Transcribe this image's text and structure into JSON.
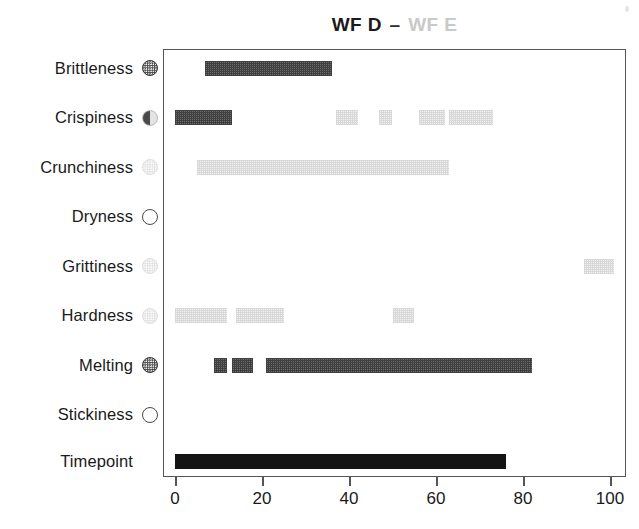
{
  "title": {
    "left": "WF D",
    "dash": "–",
    "right": "WF E",
    "left_color": "#1a1a1a",
    "right_color": "#c9c9c9",
    "full": "WF D – WF E"
  },
  "axes": {
    "x_ticks": [
      "0",
      "20",
      "40",
      "60",
      "80",
      "100"
    ],
    "x_tick_values": [
      0,
      20,
      40,
      60,
      80,
      100
    ],
    "xlim": [
      -1.5,
      105
    ],
    "xlabel": "",
    "ylabel": ""
  },
  "categories": [
    {
      "label": "Brittleness",
      "marker": "dark-dotted-circle"
    },
    {
      "label": "Crispiness",
      "marker": "half-dark-circle"
    },
    {
      "label": "Crunchiness",
      "marker": "light-dotted-circle"
    },
    {
      "label": "Dryness",
      "marker": "open-circle"
    },
    {
      "label": "Grittiness",
      "marker": "light-dotted-circle"
    },
    {
      "label": "Hardness",
      "marker": "light-dotted-circle"
    },
    {
      "label": "Melting",
      "marker": "dark-dotted-circle"
    },
    {
      "label": "Stickiness",
      "marker": "open-circle"
    },
    {
      "label": "Timepoint",
      "marker": "none"
    }
  ],
  "chart_data": {
    "type": "bar",
    "title": "WF D – WF E",
    "xlabel": "",
    "ylabel": "",
    "xlim": [
      -1.5,
      105
    ],
    "grid": false,
    "legend_position": "title",
    "orientation": "horizontal-interval",
    "categories": [
      "Brittleness",
      "Crispiness",
      "Crunchiness",
      "Dryness",
      "Grittiness",
      "Hardness",
      "Melting",
      "Stickiness",
      "Timepoint"
    ],
    "series": [
      {
        "name": "WF D",
        "color": "#4a4a4a",
        "style": "dark-checker"
      },
      {
        "name": "WF E",
        "color": "#e3e3e3",
        "style": "light-checker"
      },
      {
        "name": "Timepoint",
        "color": "#141414",
        "style": "solid"
      }
    ],
    "rows": [
      {
        "category": "Brittleness",
        "segments": [
          {
            "series": "WF D",
            "start": 7,
            "end": 36
          }
        ]
      },
      {
        "category": "Crispiness",
        "segments": [
          {
            "series": "WF D",
            "start": 0,
            "end": 13
          },
          {
            "series": "WF E",
            "start": 37,
            "end": 42
          },
          {
            "series": "WF E",
            "start": 47,
            "end": 50
          },
          {
            "series": "WF E",
            "start": 56,
            "end": 62
          },
          {
            "series": "WF E",
            "start": 63,
            "end": 73
          }
        ]
      },
      {
        "category": "Crunchiness",
        "segments": [
          {
            "series": "WF E",
            "start": 5,
            "end": 63
          }
        ]
      },
      {
        "category": "Dryness",
        "segments": []
      },
      {
        "category": "Grittiness",
        "segments": [
          {
            "series": "WF E",
            "start": 94,
            "end": 101
          }
        ]
      },
      {
        "category": "Hardness",
        "segments": [
          {
            "series": "WF E",
            "start": 0,
            "end": 12
          },
          {
            "series": "WF E",
            "start": 14,
            "end": 25
          },
          {
            "series": "WF E",
            "start": 50,
            "end": 55
          }
        ]
      },
      {
        "category": "Melting",
        "segments": [
          {
            "series": "WF D",
            "start": 9,
            "end": 12
          },
          {
            "series": "WF D",
            "start": 13,
            "end": 18
          },
          {
            "series": "WF D",
            "start": 21,
            "end": 82
          }
        ]
      },
      {
        "category": "Stickiness",
        "segments": []
      },
      {
        "category": "Timepoint",
        "segments": [
          {
            "series": "Timepoint",
            "start": 0,
            "end": 76
          }
        ]
      }
    ]
  }
}
